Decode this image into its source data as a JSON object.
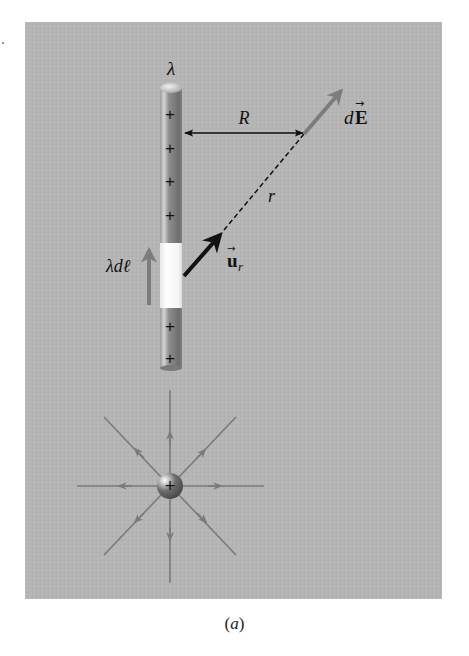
{
  "figure": {
    "panel": {
      "background": "#b4b4b4",
      "x": 25,
      "y": 22,
      "width": 417,
      "height": 577
    },
    "caption": {
      "open": "(",
      "letter": "a",
      "close": ")"
    }
  },
  "line_charge": {
    "label": "λ",
    "charge_signs": [
      "+",
      "+",
      "+",
      "+",
      "+",
      "+"
    ],
    "element_label": "λdℓ",
    "colors": {
      "rod": "#8a8a8a",
      "rod_highlight": "#c8c8c8",
      "element": "#ffffff"
    }
  },
  "geometry_labels": {
    "perpendicular_distance": "R",
    "distance": "r",
    "unit_vector": {
      "symbol": "u",
      "subscript": "r",
      "arrow": "→"
    },
    "field_element": {
      "prefix": "d",
      "symbol": "E",
      "arrow": "→"
    }
  },
  "point_charge": {
    "sign": "+",
    "field_line_count": 8,
    "colors": {
      "field_lines": "#7a7a7a",
      "charge": "#6a6a6a"
    }
  },
  "colors": {
    "ink": "#111111",
    "gray_arrow": "#7c7c7c",
    "panel": "#b4b4b4"
  }
}
